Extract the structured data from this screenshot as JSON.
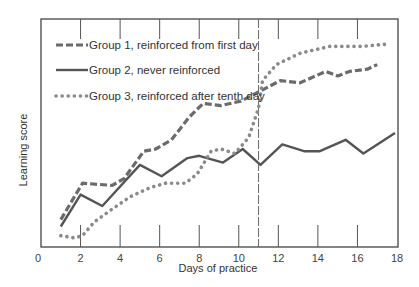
{
  "chart_data": {
    "type": "line",
    "title": "",
    "xlabel": "Days of practice",
    "ylabel": "Learning score",
    "xlim": [
      0,
      18
    ],
    "ylim": [
      0,
      100
    ],
    "x_ticks": [
      0,
      2,
      4,
      6,
      8,
      10,
      12,
      14,
      16,
      18
    ],
    "y_ticks": [],
    "grid": false,
    "legend_position": "upper-left (inside)",
    "annotations": [
      {
        "type": "vertical-dashed-line",
        "x": 11,
        "note": "start of reinforcement for Group 3"
      }
    ],
    "series": [
      {
        "name": "Group 1, reinforced from first day",
        "style": "dashed",
        "color": "#6b6b6b",
        "x": [
          1,
          2.1,
          3.6,
          4.2,
          5.2,
          5.8,
          6.6,
          7.5,
          8.2,
          9.1,
          10.1,
          11.0,
          12.1,
          13.1,
          14.4,
          15.0,
          15.6,
          16.5,
          17.0
        ],
        "y": [
          12,
          28,
          27,
          30,
          42,
          43,
          47,
          57,
          63,
          62,
          64,
          68,
          73,
          72,
          77,
          75,
          77,
          78,
          80
        ]
      },
      {
        "name": "Group 2, never reinforced",
        "style": "solid",
        "color": "#555555",
        "x": [
          1,
          2,
          3.1,
          5,
          6.1,
          7.4,
          8,
          9.2,
          10.2,
          11.1,
          12.2,
          13.3,
          14.1,
          15.4,
          16.3,
          17.9
        ],
        "y": [
          9,
          23,
          18,
          36,
          31,
          39,
          40,
          37,
          43,
          36,
          45,
          42,
          42,
          47,
          41,
          50
        ]
      },
      {
        "name": "Group 3, reinforced after tenth day",
        "style": "dotted",
        "color": "#8a8a8a",
        "x": [
          1,
          1.7,
          2.1,
          2.7,
          3.5,
          4.5,
          5.5,
          6.3,
          7.3,
          7.9,
          8.6,
          9.1,
          9.8,
          10.5,
          11.0,
          11.2,
          11.9,
          13.1,
          14.6,
          16.2,
          17.5
        ],
        "y": [
          5,
          4,
          5,
          11,
          16,
          22,
          26,
          28,
          28,
          32,
          42,
          43,
          41,
          48,
          61,
          73,
          80,
          85,
          88,
          88,
          89
        ]
      }
    ]
  },
  "legend": [
    {
      "label": "Group 1, reinforced from first day",
      "style": "dashed"
    },
    {
      "label": "Group 2, never reinforced",
      "style": "solid"
    },
    {
      "label": "Group 3, reinforced after tenth day",
      "style": "dotted"
    }
  ],
  "axes": {
    "x_title": "Days of practice",
    "y_title": "Learning score",
    "x_tick_labels": [
      "0",
      "2",
      "4",
      "6",
      "8",
      "10",
      "12",
      "14",
      "16",
      "18"
    ]
  }
}
